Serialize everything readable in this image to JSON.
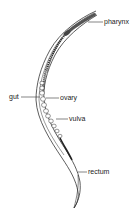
{
  "diagram": {
    "colors": {
      "outline": "#333333",
      "fill": "#ffffff",
      "dark": "#222222",
      "background": "#ffffff"
    },
    "labels": [
      {
        "id": "pharynx",
        "text": "pharynx",
        "x": 104,
        "y": 18
      },
      {
        "id": "gut",
        "text": "gut",
        "x": 9,
        "y": 93
      },
      {
        "id": "ovary",
        "text": "ovary",
        "x": 60,
        "y": 94
      },
      {
        "id": "vulva",
        "text": "vulva",
        "x": 69,
        "y": 115
      },
      {
        "id": "rectum",
        "text": "rectum",
        "x": 88,
        "y": 168
      }
    ]
  }
}
